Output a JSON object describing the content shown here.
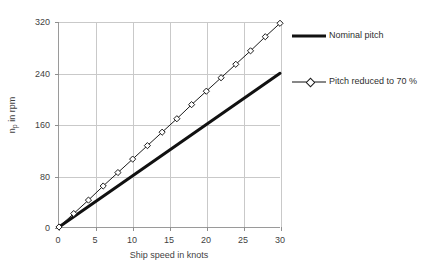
{
  "chart_data": {
    "type": "line",
    "title": "",
    "xlabel": "Ship speed in knots",
    "ylabel": "n_p in rpm",
    "ylabel_base": "n",
    "ylabel_sub": "p",
    "ylabel_rest": " in rpm",
    "xlim": [
      0,
      30
    ],
    "ylim": [
      0,
      320
    ],
    "xticks": [
      0,
      5,
      10,
      15,
      20,
      25,
      30
    ],
    "yticks": [
      0,
      80,
      160,
      240,
      320
    ],
    "xtick_labels": [
      "0",
      "5",
      "10",
      "15",
      "20",
      "25",
      "30"
    ],
    "ytick_labels": [
      "0",
      "80",
      "160",
      "240",
      "320"
    ],
    "grid": true,
    "grid_color": "#c9c9c9",
    "axis_color": "#9a9a9a",
    "legend_position": "right",
    "series": [
      {
        "name": "Nominal pitch",
        "style": "thick-line",
        "marker": "none",
        "color": "#111111",
        "line_width": 3,
        "x": [
          0,
          30
        ],
        "values": [
          0,
          240
        ]
      },
      {
        "name": "Pitch reduced to 70 %",
        "style": "thin-line-markers",
        "marker": "diamond",
        "color": "#1a1a1a",
        "line_width": 1,
        "x": [
          0,
          2,
          4,
          6,
          8,
          10,
          12,
          14,
          16,
          18,
          20,
          22,
          24,
          26,
          28,
          30
        ],
        "values": [
          0,
          21,
          42,
          64,
          85,
          106,
          127,
          148,
          169,
          191,
          212,
          233,
          254,
          275,
          297,
          318
        ]
      }
    ]
  },
  "legend": {
    "entries": [
      {
        "label": "Nominal pitch"
      },
      {
        "label": "Pitch reduced to 70 %"
      }
    ]
  }
}
